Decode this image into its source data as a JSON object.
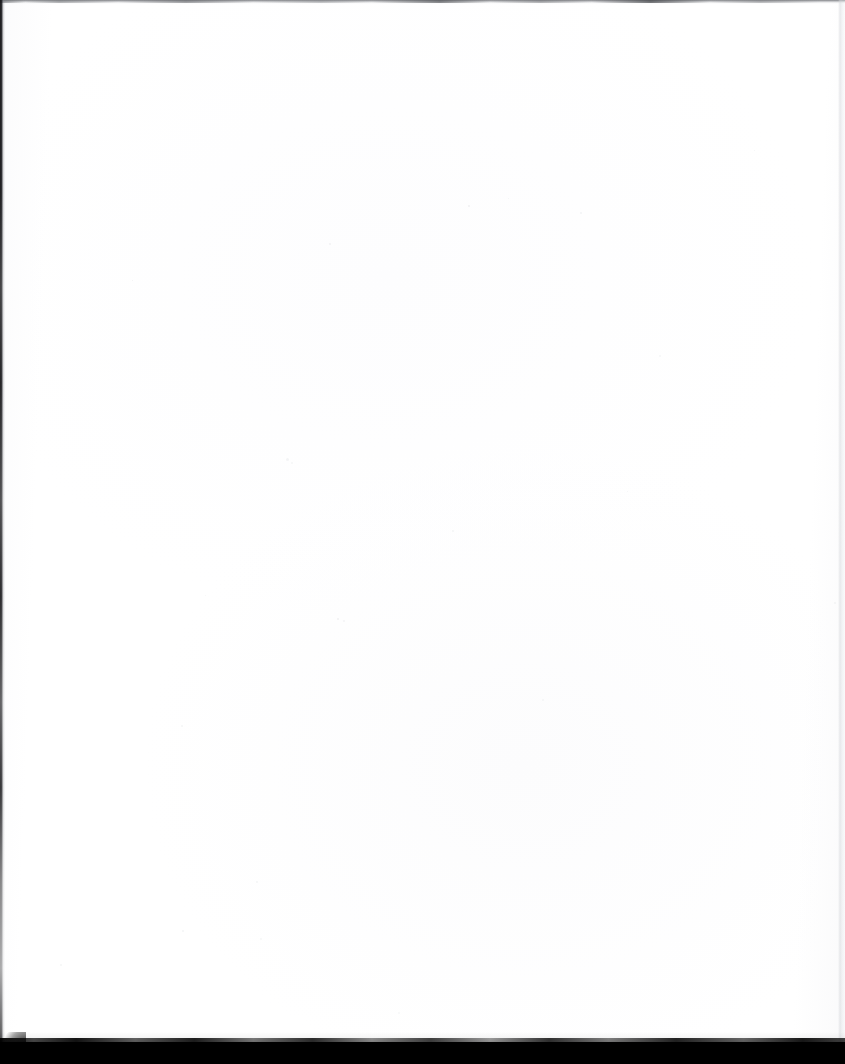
{
  "page": {
    "kind": "scanned-blank-page",
    "width": 845,
    "height": 1064,
    "visible_text": "",
    "body_text": "",
    "page_number": "",
    "header_text": "",
    "footer_text": "",
    "colors": {
      "paper": "#ffffff",
      "scanner_background": "#000000",
      "gutter_shadow": "#101012",
      "top_edge": "#787a7e",
      "right_edge_line": "#d6d8dc",
      "speck": "#cfd1d4"
    }
  },
  "edges": {
    "top_band": {
      "label": "",
      "height_px": 4,
      "color": "#787a7e"
    },
    "left_gutter": {
      "label": "",
      "width_px": 5,
      "color": "#101012"
    },
    "right_edge": {
      "label": "",
      "width_px": 7,
      "color": "#d6d8dc"
    },
    "bottom_band": {
      "label": "",
      "height_px": 22,
      "color": "#000000"
    }
  },
  "artifacts": {
    "label": "",
    "specks": [
      {
        "x": 468,
        "y": 205,
        "size": 2,
        "opacity": 0.3
      },
      {
        "x": 580,
        "y": 212,
        "size": 2,
        "opacity": 0.22
      },
      {
        "x": 329,
        "y": 243,
        "size": 2,
        "opacity": 0.26
      },
      {
        "x": 132,
        "y": 280,
        "size": 1,
        "opacity": 0.28
      },
      {
        "x": 508,
        "y": 198,
        "size": 1,
        "opacity": 0.2
      },
      {
        "x": 286,
        "y": 458,
        "size": 3,
        "opacity": 0.22
      },
      {
        "x": 291,
        "y": 462,
        "size": 2,
        "opacity": 0.18
      },
      {
        "x": 452,
        "y": 530,
        "size": 2,
        "opacity": 0.2
      },
      {
        "x": 337,
        "y": 618,
        "size": 2,
        "opacity": 0.28
      },
      {
        "x": 343,
        "y": 620,
        "size": 2,
        "opacity": 0.24
      },
      {
        "x": 542,
        "y": 699,
        "size": 2,
        "opacity": 0.18
      },
      {
        "x": 181,
        "y": 725,
        "size": 2,
        "opacity": 0.2
      },
      {
        "x": 256,
        "y": 881,
        "size": 2,
        "opacity": 0.2
      },
      {
        "x": 182,
        "y": 930,
        "size": 2,
        "opacity": 0.22
      },
      {
        "x": 260,
        "y": 938,
        "size": 2,
        "opacity": 0.18
      },
      {
        "x": 659,
        "y": 355,
        "size": 2,
        "opacity": 0.18
      },
      {
        "x": 834,
        "y": 602,
        "size": 2,
        "opacity": 0.2
      },
      {
        "x": 627,
        "y": 491,
        "size": 1,
        "opacity": 0.22
      },
      {
        "x": 754,
        "y": 150,
        "size": 1,
        "opacity": 0.2
      },
      {
        "x": 205,
        "y": 595,
        "size": 1,
        "opacity": 0.18
      },
      {
        "x": 398,
        "y": 1012,
        "size": 2,
        "opacity": 0.16
      },
      {
        "x": 60,
        "y": 964,
        "size": 2,
        "opacity": 0.2
      }
    ]
  }
}
